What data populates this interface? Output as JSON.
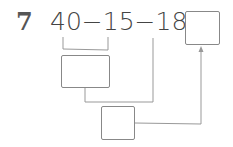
{
  "problem": {
    "number": "7",
    "expression": "40−15−18=",
    "terms": [
      "40",
      "−",
      "15",
      "−",
      "18",
      "="
    ]
  },
  "boxes": {
    "answer": "",
    "step1": "",
    "step2": ""
  },
  "colors": {
    "line": "#999999",
    "text": "#444444"
  }
}
